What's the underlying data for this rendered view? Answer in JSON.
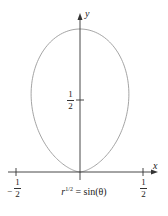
{
  "chart_data": {
    "type": "line",
    "subtype": "polar-curve",
    "equation": "r^(1/2) = sin(θ)",
    "caption_base": "r",
    "caption_exp": "1/2",
    "caption_rhs": " = sin(θ)",
    "xlabel": "x",
    "ylabel": "y",
    "x_ticks": [
      {
        "value": -0.5,
        "num": "1",
        "den": "2",
        "sign": "−"
      },
      {
        "value": 0.5,
        "num": "1",
        "den": "2",
        "sign": ""
      }
    ],
    "y_ticks": [
      {
        "value": 0.5,
        "num": "1",
        "den": "2"
      }
    ],
    "xlim": [
      -0.6,
      0.6
    ],
    "ylim": [
      0,
      1.05
    ],
    "grid": false,
    "legend": null,
    "curve_description": "Closed teardrop/oval loop symmetric about y-axis, from origin up to (0,1); max half-width ≈ 0.38 near y ≈ 0.58",
    "sample_points": [
      {
        "theta_deg": 0,
        "x": 0.0,
        "y": 0.0
      },
      {
        "theta_deg": 30,
        "x": 0.217,
        "y": 0.125
      },
      {
        "theta_deg": 45,
        "x": 0.354,
        "y": 0.354
      },
      {
        "theta_deg": 60,
        "x": 0.375,
        "y": 0.65
      },
      {
        "theta_deg": 75,
        "x": 0.224,
        "y": 0.837
      },
      {
        "theta_deg": 90,
        "x": 0.0,
        "y": 1.0
      },
      {
        "theta_deg": 105,
        "x": -0.224,
        "y": 0.837
      },
      {
        "theta_deg": 120,
        "x": -0.375,
        "y": 0.65
      },
      {
        "theta_deg": 135,
        "x": -0.354,
        "y": 0.354
      },
      {
        "theta_deg": 150,
        "x": -0.217,
        "y": 0.125
      },
      {
        "theta_deg": 180,
        "x": 0.0,
        "y": 0.0
      }
    ],
    "colors": {
      "axes": "#333333",
      "curve": "#9a9a9a",
      "text": "#222222"
    }
  }
}
